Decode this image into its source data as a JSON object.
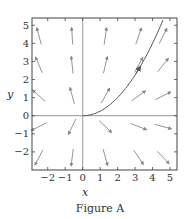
{
  "figure": {
    "caption": "Figure A"
  },
  "chart_data": {
    "type": "vector_field",
    "title": "",
    "caption": "Figure A",
    "xlabel": "x",
    "ylabel": "y",
    "xlim": [
      -2.9,
      5.4
    ],
    "ylim": [
      -3.0,
      5.4
    ],
    "xticks": [
      -2,
      -1,
      0,
      1,
      2,
      3,
      4,
      5
    ],
    "yticks": [
      -2,
      -1,
      0,
      1,
      2,
      3,
      4,
      5
    ],
    "xtick_labels": [
      "−2",
      "−1",
      "0",
      "1",
      "2",
      "3",
      "4",
      "5"
    ],
    "ytick_labels": [
      "−2",
      "−1",
      "0",
      "1",
      "2",
      "3",
      "4",
      "5"
    ],
    "grid": false,
    "axes_lines": [
      "x=0",
      "y=0"
    ],
    "field": {
      "description": "direction field, dx/dt = x, dy/dt = 2y (all arrows point away from origin)",
      "arrow_x": [
        -2.5,
        -0.6,
        1.3,
        3.2,
        4.6
      ],
      "arrow_y": [
        4.4,
        2.8,
        1.1,
        -0.6,
        -2.3
      ]
    },
    "curve": {
      "description": "solution curve y = x^2/4 for x >= 0",
      "equation": "y = x^2 / 4",
      "x_range": [
        0,
        4.6
      ],
      "arrow_at": [
        3.2,
        2.5
      ]
    },
    "colors": {
      "frame": "#444444",
      "axes": "#aaaaaa",
      "arrows": "#888888",
      "curve": "#555555"
    }
  }
}
